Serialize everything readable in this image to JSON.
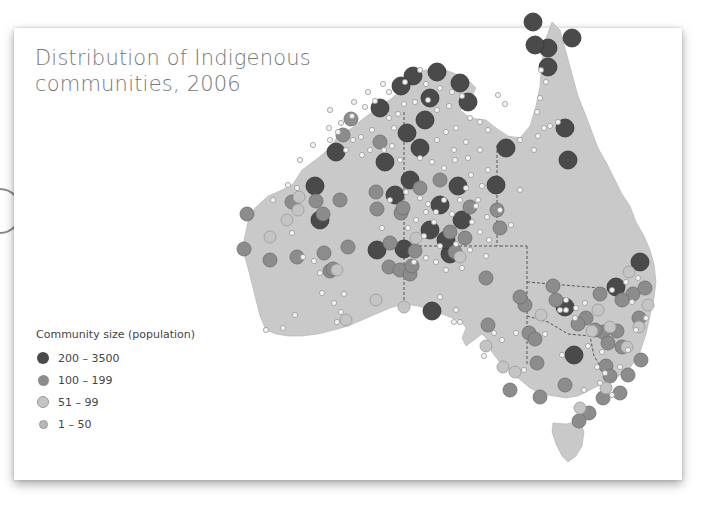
{
  "title_lines": [
    "Distribution of Indigenous",
    "communities, 2006"
  ],
  "legend": {
    "title": "Community size (population)",
    "items": [
      {
        "label": "200 – 3500",
        "color": "#4a4a4a",
        "size": 12
      },
      {
        "label": "100 – 199",
        "color": "#8c8c8c",
        "size": 11
      },
      {
        "label": "51 – 99",
        "color": "#c4c4c4",
        "size": 10
      },
      {
        "label": "1 – 50",
        "color": "#b8b8b8",
        "size": 7
      }
    ]
  },
  "colors": {
    "land": "#c9c9c9",
    "border": "#555555",
    "large": "#4a4a4a",
    "medium": "#8c8c8c",
    "small": "#c4c4c4",
    "tiny": "#f2f2f2"
  },
  "chart_data": {
    "type": "map",
    "title": "Distribution of Indigenous communities, 2006",
    "legend_title": "Community size (population)",
    "categories": [
      "200 – 3500",
      "100 – 199",
      "51 – 99",
      "1 – 50"
    ],
    "region": "Australia",
    "points": {
      "large": [
        [
          413,
          76
        ],
        [
          437,
          72
        ],
        [
          533,
          22
        ],
        [
          548,
          48
        ],
        [
          380,
          108
        ],
        [
          407,
          133
        ],
        [
          425,
          120
        ],
        [
          420,
          148
        ],
        [
          410,
          180
        ],
        [
          506,
          148
        ],
        [
          496,
          185
        ],
        [
          377,
          250
        ],
        [
          458,
          186
        ],
        [
          440,
          205
        ],
        [
          395,
          195
        ],
        [
          320,
          220
        ],
        [
          568,
          160
        ],
        [
          535,
          45
        ],
        [
          565,
          128
        ],
        [
          640,
          262
        ],
        [
          616,
          287
        ],
        [
          565,
          307
        ],
        [
          574,
          355
        ],
        [
          432,
          311
        ],
        [
          404,
          249
        ],
        [
          450,
          254
        ],
        [
          385,
          162
        ],
        [
          430,
          230
        ],
        [
          462,
          220
        ],
        [
          446,
          240
        ],
        [
          548,
          67
        ],
        [
          572,
          38
        ],
        [
          336,
          152
        ],
        [
          315,
          186
        ],
        [
          401,
          86
        ],
        [
          430,
          98
        ],
        [
          468,
          102
        ],
        [
          460,
          83
        ]
      ],
      "medium": [
        [
          389,
          267
        ],
        [
          400,
          270
        ],
        [
          410,
          274
        ],
        [
          412,
          266
        ],
        [
          324,
          253
        ],
        [
          330,
          271
        ],
        [
          348,
          247
        ],
        [
          340,
          200
        ],
        [
          316,
          201
        ],
        [
          323,
          214
        ],
        [
          415,
          251
        ],
        [
          376,
          192
        ],
        [
          377,
          209
        ],
        [
          401,
          213
        ],
        [
          390,
          243
        ],
        [
          455,
          252
        ],
        [
          465,
          238
        ],
        [
          486,
          278
        ],
        [
          525,
          305
        ],
        [
          529,
          333
        ],
        [
          535,
          339
        ],
        [
          586,
          318
        ],
        [
          578,
          324
        ],
        [
          603,
          332
        ],
        [
          617,
          331
        ],
        [
          622,
          347
        ],
        [
          606,
          366
        ],
        [
          610,
          376
        ],
        [
          603,
          398
        ],
        [
          565,
          385
        ],
        [
          537,
          363
        ],
        [
          488,
          325
        ],
        [
          520,
          297
        ],
        [
          553,
          286
        ],
        [
          600,
          294
        ],
        [
          633,
          294
        ],
        [
          645,
          288
        ],
        [
          622,
          300
        ],
        [
          639,
          318
        ],
        [
          641,
          360
        ],
        [
          628,
          375
        ],
        [
          620,
          393
        ],
        [
          556,
          300
        ],
        [
          270,
          260
        ],
        [
          244,
          249
        ],
        [
          297,
          257
        ],
        [
          247,
          214
        ],
        [
          292,
          202
        ],
        [
          333,
          269
        ],
        [
          450,
          232
        ],
        [
          403,
          208
        ],
        [
          470,
          207
        ],
        [
          420,
          188
        ],
        [
          440,
          180
        ],
        [
          497,
          210
        ],
        [
          500,
          228
        ],
        [
          380,
          142
        ],
        [
          351,
          119
        ],
        [
          343,
          135
        ],
        [
          540,
          397
        ],
        [
          595,
          330
        ],
        [
          608,
          343
        ],
        [
          589,
          413
        ],
        [
          510,
          390
        ],
        [
          579,
          421
        ]
      ],
      "small": [
        [
          346,
          320
        ],
        [
          337,
          270
        ],
        [
          270,
          237
        ],
        [
          298,
          210
        ],
        [
          299,
          197
        ],
        [
          416,
          238
        ],
        [
          404,
          307
        ],
        [
          460,
          257
        ],
        [
          592,
          331
        ],
        [
          598,
          310
        ],
        [
          639,
          327
        ],
        [
          648,
          305
        ],
        [
          627,
          347
        ],
        [
          515,
          372
        ],
        [
          629,
          272
        ],
        [
          610,
          327
        ],
        [
          541,
          315
        ],
        [
          606,
          388
        ],
        [
          580,
          408
        ],
        [
          503,
          367
        ],
        [
          486,
          346
        ],
        [
          287,
          220
        ],
        [
          376,
          300
        ]
      ],
      "tiny": [
        [
          420,
          70
        ],
        [
          426,
          84
        ],
        [
          440,
          88
        ],
        [
          452,
          92
        ],
        [
          462,
          96
        ],
        [
          449,
          106
        ],
        [
          437,
          110
        ],
        [
          428,
          100
        ],
        [
          415,
          102
        ],
        [
          404,
          104
        ],
        [
          398,
          114
        ],
        [
          389,
          118
        ],
        [
          394,
          128
        ],
        [
          372,
          130
        ],
        [
          361,
          137
        ],
        [
          353,
          140
        ],
        [
          338,
          132
        ],
        [
          329,
          128
        ],
        [
          346,
          150
        ],
        [
          362,
          155
        ],
        [
          370,
          150
        ],
        [
          384,
          150
        ],
        [
          392,
          146
        ],
        [
          400,
          160
        ],
        [
          420,
          158
        ],
        [
          432,
          162
        ],
        [
          444,
          168
        ],
        [
          455,
          160
        ],
        [
          468,
          158
        ],
        [
          480,
          150
        ],
        [
          488,
          170
        ],
        [
          420,
          198
        ],
        [
          428,
          204
        ],
        [
          436,
          212
        ],
        [
          444,
          200
        ],
        [
          452,
          214
        ],
        [
          460,
          200
        ],
        [
          466,
          188
        ],
        [
          476,
          206
        ],
        [
          472,
          222
        ],
        [
          480,
          232
        ],
        [
          434,
          222
        ],
        [
          426,
          212
        ],
        [
          416,
          220
        ],
        [
          408,
          228
        ],
        [
          424,
          236
        ],
        [
          440,
          246
        ],
        [
          456,
          244
        ],
        [
          462,
          268
        ],
        [
          470,
          250
        ],
        [
          486,
          256
        ],
        [
          489,
          240
        ],
        [
          436,
          262
        ],
        [
          446,
          270
        ],
        [
          414,
          262
        ],
        [
          426,
          258
        ],
        [
          390,
          200
        ],
        [
          406,
          192
        ],
        [
          382,
          228
        ],
        [
          288,
          185
        ],
        [
          297,
          188
        ],
        [
          273,
          200
        ],
        [
          292,
          233
        ],
        [
          314,
          261
        ],
        [
          320,
          273
        ],
        [
          322,
          293
        ],
        [
          295,
          315
        ],
        [
          283,
          328
        ],
        [
          266,
          330
        ],
        [
          344,
          294
        ],
        [
          341,
          312
        ],
        [
          337,
          322
        ],
        [
          303,
          257
        ],
        [
          334,
          303
        ],
        [
          541,
          70
        ],
        [
          546,
          82
        ],
        [
          540,
          98
        ],
        [
          537,
          112
        ],
        [
          544,
          128
        ],
        [
          538,
          136
        ],
        [
          534,
          150
        ],
        [
          550,
          126
        ],
        [
          558,
          122
        ],
        [
          505,
          104
        ],
        [
          498,
          95
        ],
        [
          520,
          140
        ],
        [
          520,
          190
        ],
        [
          500,
          210
        ],
        [
          511,
          225
        ],
        [
          487,
          217
        ],
        [
          478,
          200
        ],
        [
          566,
          300
        ],
        [
          566,
          310
        ],
        [
          576,
          308
        ],
        [
          575,
          318
        ],
        [
          588,
          346
        ],
        [
          597,
          367
        ],
        [
          584,
          390
        ],
        [
          600,
          383
        ],
        [
          638,
          278
        ],
        [
          626,
          282
        ],
        [
          612,
          290
        ],
        [
          632,
          302
        ],
        [
          646,
          318
        ],
        [
          636,
          330
        ],
        [
          612,
          395
        ],
        [
          494,
          333
        ],
        [
          454,
          322
        ],
        [
          456,
          310
        ],
        [
          460,
          322
        ],
        [
          440,
          297
        ],
        [
          484,
          356
        ],
        [
          516,
          333
        ],
        [
          545,
          334
        ],
        [
          562,
          355
        ],
        [
          524,
          370
        ],
        [
          502,
          340
        ],
        [
          560,
          310
        ],
        [
          628,
          350
        ],
        [
          620,
          367
        ],
        [
          585,
          303
        ],
        [
          602,
          352
        ],
        [
          605,
          373
        ],
        [
          405,
          82
        ],
        [
          389,
          92
        ],
        [
          375,
          101
        ],
        [
          365,
          107
        ],
        [
          352,
          116
        ],
        [
          341,
          123
        ],
        [
          330,
          140
        ],
        [
          313,
          145
        ],
        [
          300,
          160
        ],
        [
          330,
          110
        ],
        [
          354,
          102
        ],
        [
          368,
          92
        ],
        [
          383,
          84
        ],
        [
          437,
          140
        ],
        [
          446,
          132
        ],
        [
          456,
          128
        ],
        [
          466,
          142
        ],
        [
          470,
          118
        ],
        [
          480,
          122
        ],
        [
          488,
          130
        ],
        [
          454,
          150
        ],
        [
          471,
          175
        ],
        [
          482,
          186
        ]
      ]
    }
  }
}
